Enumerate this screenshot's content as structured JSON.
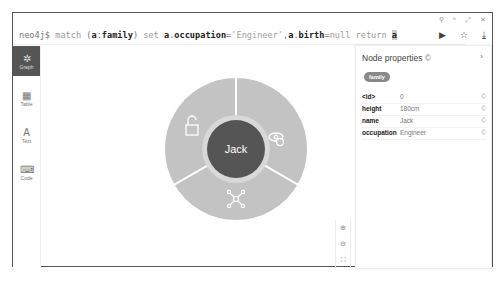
{
  "window_controls": [
    "pin-icon",
    "collapse-icon",
    "expand-icon",
    "close-icon"
  ],
  "editor": {
    "prompt": "neo4j$",
    "query": "match (a:family) set a.occupation='Engineer',a.birth=null return a"
  },
  "actions": {
    "run_label": "▶",
    "favorite_label": "☆",
    "download_label": "⤓"
  },
  "sidebar": {
    "items": [
      {
        "label": "Graph",
        "icon": "✲",
        "active": true
      },
      {
        "label": "Table",
        "icon": "▦",
        "active": false
      },
      {
        "label": "Text",
        "icon": "A",
        "active": false
      },
      {
        "label": "Code",
        "icon": "⌨",
        "active": false
      }
    ]
  },
  "node": {
    "caption": "Jack",
    "ring_actions": [
      "unlock-icon",
      "hide-icon",
      "expand-relations-icon"
    ]
  },
  "zoom_controls": [
    "zoom-in-icon",
    "zoom-out-icon",
    "fit-icon"
  ],
  "panel": {
    "title": "Node properties",
    "chevron": "›",
    "label_badge": "family",
    "properties": [
      {
        "key": "<id>",
        "value": "0"
      },
      {
        "key": "height",
        "value": "180cm"
      },
      {
        "key": "name",
        "value": "Jack"
      },
      {
        "key": "occupation",
        "value": "Engineer"
      }
    ]
  }
}
